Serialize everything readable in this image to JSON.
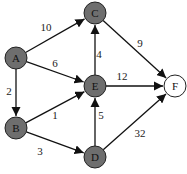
{
  "graph": {
    "directed": true,
    "nodes": [
      {
        "id": "A",
        "label": "A",
        "x": 16,
        "y": 58,
        "fill": "#6e6e6e"
      },
      {
        "id": "B",
        "label": "B",
        "x": 16,
        "y": 128,
        "fill": "#6e6e6e"
      },
      {
        "id": "C",
        "label": "C",
        "x": 95,
        "y": 13,
        "fill": "#6e6e6e"
      },
      {
        "id": "E",
        "label": "E",
        "x": 95,
        "y": 86,
        "fill": "#6e6e6e"
      },
      {
        "id": "D",
        "label": "D",
        "x": 95,
        "y": 157,
        "fill": "#6e6e6e"
      },
      {
        "id": "F",
        "label": "F",
        "x": 175,
        "y": 86,
        "fill": "#ffffff"
      }
    ],
    "edges": [
      {
        "from": "A",
        "to": "C",
        "weight": "10",
        "lx": 46,
        "ly": 31
      },
      {
        "from": "A",
        "to": "E",
        "weight": "6",
        "lx": 55,
        "ly": 67
      },
      {
        "from": "A",
        "to": "B",
        "weight": "2",
        "lx": 9,
        "ly": 95
      },
      {
        "from": "B",
        "to": "E",
        "weight": "1",
        "lx": 55,
        "ly": 119
      },
      {
        "from": "B",
        "to": "D",
        "weight": "3",
        "lx": 40,
        "ly": 155
      },
      {
        "from": "E",
        "to": "C",
        "weight": "4",
        "lx": 99,
        "ly": 58
      },
      {
        "from": "E",
        "to": "F",
        "weight": "12",
        "lx": 122,
        "ly": 80
      },
      {
        "from": "C",
        "to": "F",
        "weight": "9",
        "lx": 140,
        "ly": 47
      },
      {
        "from": "D",
        "to": "E",
        "weight": "5",
        "lx": 101,
        "ly": 119
      },
      {
        "from": "D",
        "to": "F",
        "weight": "32",
        "lx": 140,
        "ly": 137
      }
    ]
  }
}
